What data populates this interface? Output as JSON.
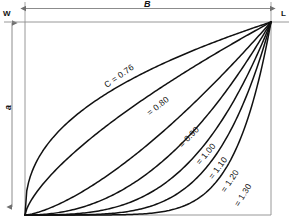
{
  "figure": {
    "background": "#ffffff",
    "line_color": "#111111",
    "frame_color": "#8d8d8d",
    "dimension_color": "#6f6f6f"
  },
  "corner_labels": {
    "top_left": "W",
    "top_right": "L"
  },
  "dimension_labels": {
    "horizontal": "B",
    "vertical": "a"
  },
  "chart_data": {
    "type": "line",
    "title": "",
    "xlabel": "B",
    "ylabel": "a",
    "xlim": [
      0,
      1
    ],
    "ylim": [
      0,
      1
    ],
    "grid": false,
    "legend": "inline-annotations",
    "parameter_symbol": "C",
    "x": [
      0,
      0.05,
      0.1,
      0.15,
      0.2,
      0.25,
      0.3,
      0.35,
      0.4,
      0.45,
      0.5,
      0.55,
      0.6,
      0.65,
      0.7,
      0.75,
      0.8,
      0.85,
      0.9,
      0.95,
      1
    ],
    "series": [
      {
        "name": "C = 0.76",
        "label": "C = 0.76",
        "exponent": 0.42,
        "label_pos": {
          "x": 0.38,
          "y": 0.72,
          "rotate": -35
        },
        "values": [
          0,
          0.285,
          0.382,
          0.452,
          0.511,
          0.561,
          0.606,
          0.647,
          0.684,
          0.719,
          0.748,
          0.781,
          0.811,
          0.839,
          0.866,
          0.891,
          0.915,
          0.939,
          0.961,
          0.983,
          1
        ]
      },
      {
        "name": "C = 0.80",
        "label": "= 0.80",
        "exponent": 0.7,
        "label_pos": {
          "x": 0.54,
          "y": 0.565,
          "rotate": -38
        },
        "values": [
          0,
          0.107,
          0.174,
          0.232,
          0.284,
          0.332,
          0.378,
          0.422,
          0.464,
          0.505,
          0.545,
          0.583,
          0.621,
          0.658,
          0.694,
          0.73,
          0.765,
          0.799,
          0.833,
          0.867,
          1
        ]
      },
      {
        "name": "C = 0.90",
        "label": "= 0.90",
        "exponent": 1.45,
        "label_pos": {
          "x": 0.665,
          "y": 0.405,
          "rotate": -46
        },
        "values": [
          0,
          0.015,
          0.041,
          0.073,
          0.11,
          0.152,
          0.197,
          0.245,
          0.296,
          0.35,
          0.406,
          0.465,
          0.526,
          0.589,
          0.654,
          0.721,
          0.79,
          0.861,
          0.934,
          1.0,
          1
        ]
      },
      {
        "name": "C = 1.00",
        "label": "= 1.00",
        "exponent": 2.2,
        "label_pos": {
          "x": 0.735,
          "y": 0.315,
          "rotate": -50
        },
        "values": [
          0,
          0.0013,
          0.0063,
          0.0158,
          0.0302,
          0.0497,
          0.0746,
          0.1049,
          0.1408,
          0.1824,
          0.2297,
          0.2828,
          0.3417,
          0.4065,
          0.4772,
          0.5538,
          0.6364,
          0.725,
          0.8195,
          0.92,
          1
        ]
      },
      {
        "name": "C = 1.10",
        "label": "= 1.10",
        "exponent": 3.2,
        "label_pos": {
          "x": 0.785,
          "y": 0.245,
          "rotate": -53
        },
        "values": [
          0,
          0.0001,
          0.001,
          0.0033,
          0.0076,
          0.0147,
          0.0252,
          0.0399,
          0.0595,
          0.0848,
          0.1166,
          0.1555,
          0.2024,
          0.258,
          0.3231,
          0.3985,
          0.485,
          0.5834,
          0.6945,
          0.8191,
          1
        ]
      },
      {
        "name": "C = 1.20",
        "label": "= 1.20",
        "exponent": 4.6,
        "label_pos": {
          "x": 0.835,
          "y": 0.175,
          "rotate": -56
        },
        "values": [
          0,
          0.0,
          0.0001,
          0.0004,
          0.0013,
          0.0031,
          0.0065,
          0.0121,
          0.0208,
          0.0335,
          0.0512,
          0.0751,
          0.1065,
          0.1468,
          0.1976,
          0.2605,
          0.3373,
          0.43,
          0.5406,
          0.6713,
          1
        ]
      },
      {
        "name": "C = 1.30",
        "label": "= 1.30",
        "exponent": 7.0,
        "label_pos": {
          "x": 0.885,
          "y": 0.105,
          "rotate": -58
        },
        "values": [
          0,
          0.0,
          0.0,
          0.0,
          0.0001,
          0.0001,
          0.0002,
          0.0006,
          0.0016,
          0.0037,
          0.0078,
          0.0152,
          0.028,
          0.049,
          0.0824,
          0.1335,
          0.2097,
          0.3206,
          0.4783,
          0.6983,
          1
        ]
      }
    ]
  }
}
